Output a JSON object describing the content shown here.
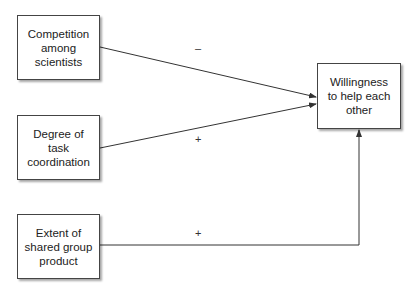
{
  "diagram": {
    "nodes": [
      {
        "id": "competition",
        "label": "Competition\namong\nscientists"
      },
      {
        "id": "coordination",
        "label": "Degree of task\ncoordination"
      },
      {
        "id": "shared_product",
        "label": "Extent of\nshared group\nproduct"
      },
      {
        "id": "willingness",
        "label": "Willingness\nto help each\nother"
      }
    ],
    "edges": [
      {
        "from": "competition",
        "to": "willingness",
        "sign": "–"
      },
      {
        "from": "coordination",
        "to": "willingness",
        "sign": "+"
      },
      {
        "from": "shared_product",
        "to": "willingness",
        "sign": "+"
      }
    ],
    "colors": {
      "line": "#333333",
      "border": "#444444"
    }
  }
}
